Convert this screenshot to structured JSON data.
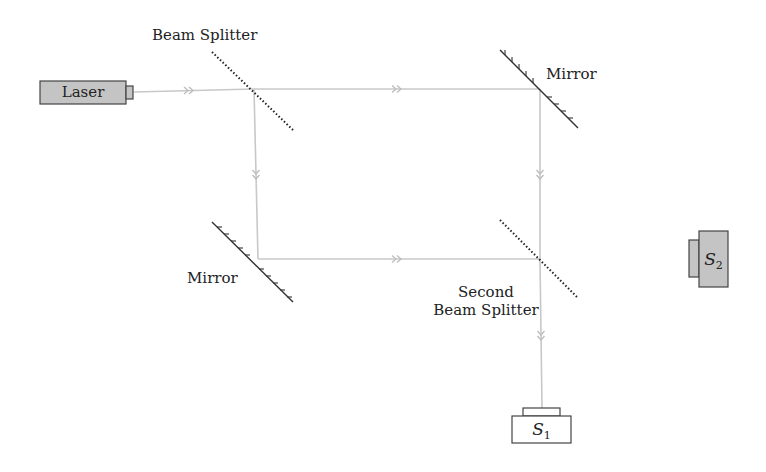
{
  "diagram": {
    "colors": {
      "beam": "#c8c8c8",
      "component_fill": "#c4c4c4",
      "component_stroke": "#444444",
      "mirror": "#333333",
      "splitter": "#222222",
      "text": "#222222"
    },
    "components": {
      "laser": {
        "label": "Laser"
      },
      "beam_splitter_1": {
        "label": "Beam Splitter"
      },
      "mirror_top_right": {
        "label": "Mirror"
      },
      "mirror_bottom_left": {
        "label": "Mirror"
      },
      "beam_splitter_2": {
        "label_line1": "Second",
        "label_line2": "Beam Splitter"
      },
      "detector_1": {
        "label_main": "S",
        "label_sub": "1"
      },
      "detector_2": {
        "label_main": "S",
        "label_sub": "2"
      }
    },
    "beams": [
      {
        "from": "laser",
        "to": "beam_splitter_1",
        "marker": "double-arrow"
      },
      {
        "from": "beam_splitter_1",
        "to": "mirror_top_right",
        "marker": "double-arrow"
      },
      {
        "from": "beam_splitter_1",
        "to": "mirror_bottom_left",
        "marker": "double-arrow"
      },
      {
        "from": "mirror_top_right",
        "to": "beam_splitter_2",
        "marker": "double-arrow"
      },
      {
        "from": "mirror_bottom_left",
        "to": "beam_splitter_2",
        "marker": "double-arrow"
      },
      {
        "from": "beam_splitter_2",
        "to": "detector_1",
        "marker": "double-arrow"
      }
    ]
  }
}
